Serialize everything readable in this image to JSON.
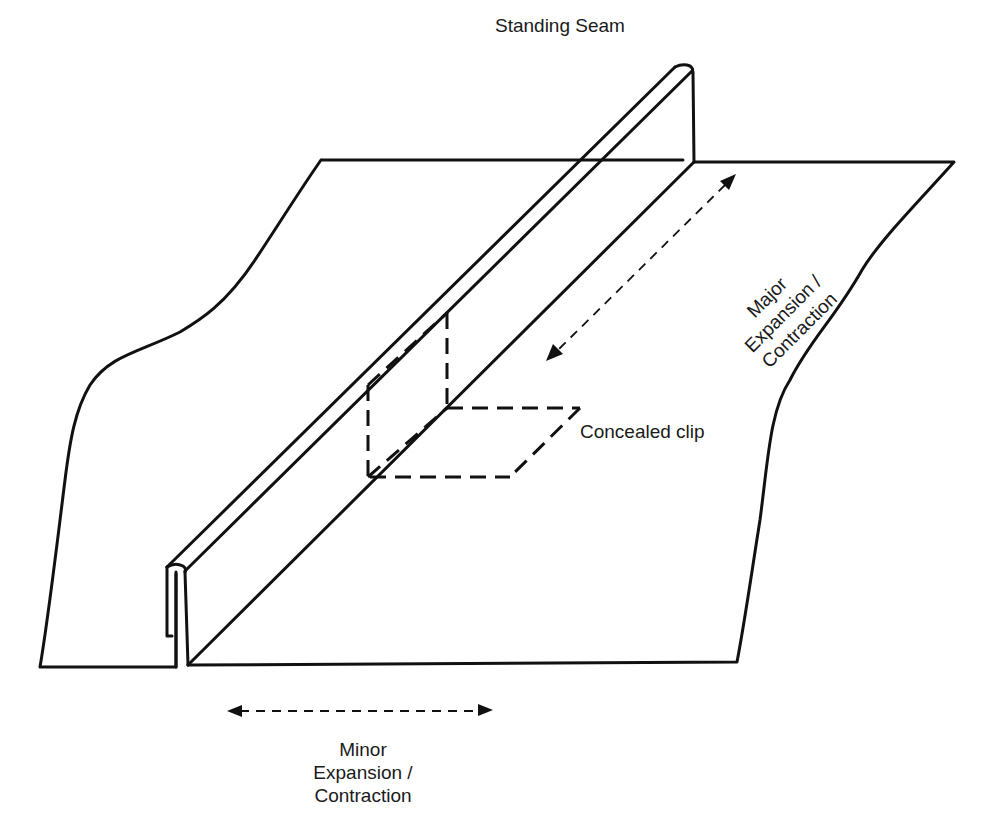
{
  "diagram": {
    "type": "standing-seam-roof-panel-illustration",
    "labels": {
      "standing_seam": "Standing Seam",
      "major_movement": [
        "Major",
        "Expansion /",
        "Contraction"
      ],
      "concealed_clip": "Concealed clip",
      "minor_movement": [
        "Minor",
        "Expansion /",
        "Contraction"
      ]
    },
    "elements": [
      {
        "id": "left-panel",
        "description": "Left roof panel with wavy cut edge"
      },
      {
        "id": "right-panel",
        "description": "Right roof panel with wavy cut edge"
      },
      {
        "id": "standing-seam",
        "description": "Vertical raised seam joining the two panels"
      },
      {
        "id": "concealed-clip",
        "description": "Hidden clip shown with dashed lines under the seam"
      },
      {
        "id": "major-arrow",
        "description": "Dashed double arrow along the seam direction"
      },
      {
        "id": "minor-arrow",
        "description": "Dashed double arrow across the seam direction"
      }
    ],
    "colors": {
      "stroke": "#111111",
      "text": "#1a1a1a",
      "background": "#ffffff"
    }
  }
}
